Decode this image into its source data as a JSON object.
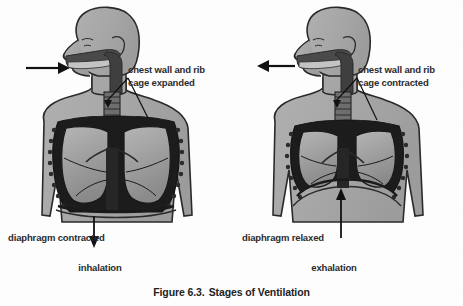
{
  "figure": {
    "caption_number": "Figure 6.3.",
    "caption_title": "Stages of Ventilation",
    "background_color": "#fdfdfd",
    "ink_color": "#2b2b2b"
  },
  "panels": [
    {
      "id": "inhalation",
      "stage_label": "inhalation",
      "chest_label": "chest wall and rib\ncage expanded",
      "diaphragm_label": "diaphragm contracted",
      "airflow_arrow": "arrow-right-into-mouth",
      "diaphragm_arrow": "arrow-down",
      "body_fill": "#a8a8a8",
      "lung_fill": "#9a9a9a",
      "cavity_fill": "#1c1c1c",
      "airway_fill": "#3a3a3a"
    },
    {
      "id": "exhalation",
      "stage_label": "exhalation",
      "chest_label": "chest wall and rib\ncage contracted",
      "diaphragm_label": "diaphragm relaxed",
      "airflow_arrow": "arrow-left-out-of-mouth",
      "diaphragm_arrow": "arrow-up",
      "body_fill": "#a8a8a8",
      "lung_fill": "#9a9a9a",
      "cavity_fill": "#1c1c1c",
      "airway_fill": "#3a3a3a"
    }
  ]
}
